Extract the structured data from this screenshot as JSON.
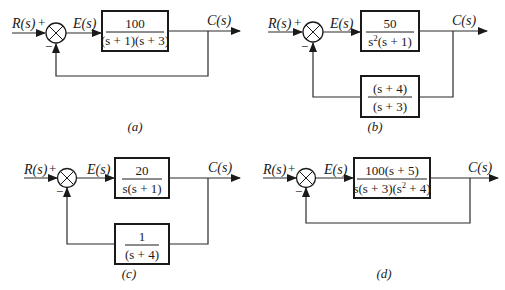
{
  "diagrams": {
    "a": {
      "caption": "(a)",
      "input_label": "R(s)",
      "plus_sign": "+",
      "minus_sign": "−",
      "error_label": "E(s)",
      "output_label": "C(s)",
      "forward": {
        "num": "100",
        "den": "(s + 1)(s + 3)"
      },
      "feedback": "unity"
    },
    "b": {
      "caption": "(b)",
      "input_label": "R(s)",
      "plus_sign": "+",
      "minus_sign": "−",
      "error_label": "E(s)",
      "output_label": "C(s)",
      "forward": {
        "num": "50",
        "den_pre": "s",
        "den_sup": "2",
        "den_post": "(s + 1)"
      },
      "feedback": {
        "num": "(s + 4)",
        "den": "(s + 3)"
      }
    },
    "c": {
      "caption": "(c)",
      "input_label": "R(s)",
      "plus_sign": "+",
      "minus_sign": "−",
      "error_label": "E(s)",
      "output_label": "C(s)",
      "forward": {
        "num": "20",
        "den": "s(s + 1)"
      },
      "feedback": {
        "num": "1",
        "den": "(s + 4)"
      }
    },
    "d": {
      "caption": "(d)",
      "input_label": "R(s)",
      "plus_sign": "+",
      "minus_sign": "−",
      "error_label": "E(s)",
      "output_label": "C(s)",
      "forward": {
        "num": "100(s + 5)",
        "den_pre": "s(s + 3)(s",
        "den_sup": "2",
        "den_post": " + 4)"
      },
      "feedback": "unity"
    }
  }
}
